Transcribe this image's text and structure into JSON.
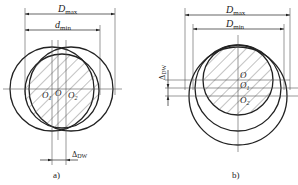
{
  "figure": {
    "panel_a": {
      "caption": "a)",
      "dim_outer": {
        "main": "D",
        "sub": "max"
      },
      "dim_inner": {
        "main": "d",
        "sub": "min"
      },
      "centers": [
        {
          "main": "O",
          "sub": "1"
        },
        {
          "main": "O",
          "sub": ""
        },
        {
          "main": "O",
          "sub": "2"
        }
      ],
      "delta": {
        "main": "Δ",
        "sub": "DW"
      }
    },
    "panel_b": {
      "caption": "b)",
      "dim_outer": {
        "main": "D",
        "sub": "max"
      },
      "dim_inner": {
        "main": "D",
        "sub": "min"
      },
      "centers": [
        {
          "main": "O",
          "sub": ""
        },
        {
          "main": "O",
          "sub": "1"
        },
        {
          "main": "O",
          "sub": "2"
        }
      ],
      "delta": {
        "main": "Δ",
        "sub": "DW"
      }
    },
    "colors": {
      "line": "#222222",
      "thin": "#555555",
      "background": "#ffffff"
    }
  }
}
